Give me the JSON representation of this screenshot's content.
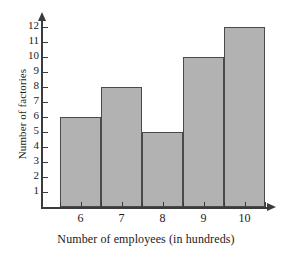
{
  "chart_data": {
    "type": "bar",
    "title": "",
    "xlabel": "Number of employees (in hundreds)",
    "ylabel": "Number of factories",
    "categories": [
      "6",
      "7",
      "8",
      "9",
      "10"
    ],
    "values": [
      6,
      8,
      5,
      10,
      12
    ],
    "ytick_labels": [
      "12",
      "11",
      "10",
      "9",
      "8",
      "7",
      "6",
      "5",
      "4",
      "3",
      "2",
      "1"
    ],
    "ytick_values": [
      12,
      11,
      10,
      9,
      8,
      7,
      6,
      5,
      4,
      3,
      2,
      1
    ],
    "xtick_labels": [
      "6",
      "7",
      "8",
      "9",
      "10"
    ],
    "ylim": [
      0,
      12.6
    ],
    "grid": false,
    "legend": false,
    "bar_fill_color": "#b2b2b2",
    "bar_edge_color": "#4a4a4a",
    "axis_color": "#3b3b3b",
    "text_color": "#1a1a1a"
  }
}
